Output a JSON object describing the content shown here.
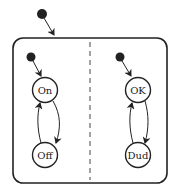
{
  "diagram": {
    "type": "state-machine",
    "regions": [
      {
        "name": "power",
        "states": [
          {
            "id": "on",
            "label": "On"
          },
          {
            "id": "off",
            "label": "Off"
          }
        ],
        "transitions": [
          {
            "from": "initial",
            "to": "On"
          },
          {
            "from": "On",
            "to": "Off"
          },
          {
            "from": "Off",
            "to": "On"
          }
        ]
      },
      {
        "name": "health",
        "states": [
          {
            "id": "ok",
            "label": "OK"
          },
          {
            "id": "dud",
            "label": "Dud"
          }
        ],
        "transitions": [
          {
            "from": "initial",
            "to": "OK"
          },
          {
            "from": "OK",
            "to": "Dud"
          },
          {
            "from": "Dud",
            "to": "OK"
          }
        ]
      }
    ],
    "colors": {
      "stroke": "#222222",
      "background": "#ffffff"
    }
  }
}
